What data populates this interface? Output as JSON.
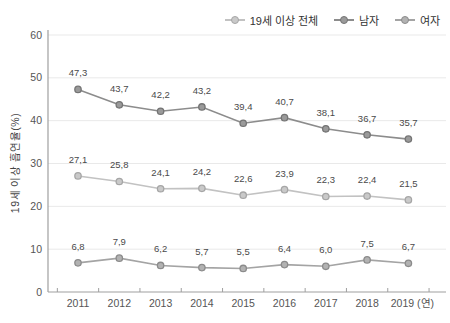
{
  "chart_data": {
    "type": "line",
    "title": "",
    "ylabel": "19세 이상 흡연율(%)",
    "xlabel": "",
    "x_suffix": "(연)",
    "categories": [
      "2011",
      "2012",
      "2013",
      "2014",
      "2015",
      "2016",
      "2017",
      "2018",
      "2019"
    ],
    "yticks": [
      0,
      10,
      20,
      30,
      40,
      50,
      60
    ],
    "ylim": [
      0,
      60
    ],
    "grid": true,
    "legend_position": "top-right",
    "series": [
      {
        "name": "19세 이상 전체",
        "values": [
          27.1,
          25.8,
          24.1,
          24.2,
          22.6,
          23.9,
          22.3,
          22.4,
          21.5
        ],
        "labels": [
          "27,1",
          "25,8",
          "24,1",
          "24,2",
          "22,6",
          "23,9",
          "22,3",
          "22,4",
          "21,5"
        ],
        "line_color": "#c2c2c2",
        "marker_fill": "#c9c9c9",
        "marker_stroke": "#a6a6a6"
      },
      {
        "name": "남자",
        "values": [
          47.3,
          43.7,
          42.2,
          43.2,
          39.4,
          40.7,
          38.1,
          36.7,
          35.7
        ],
        "labels": [
          "47,3",
          "43,7",
          "42,2",
          "43,2",
          "39,4",
          "40,7",
          "38,1",
          "36,7",
          "35,7"
        ],
        "line_color": "#8c8c8c",
        "marker_fill": "#9a9a9a",
        "marker_stroke": "#747474"
      },
      {
        "name": "여자",
        "values": [
          6.8,
          7.9,
          6.2,
          5.7,
          5.5,
          6.4,
          6.0,
          7.5,
          6.7
        ],
        "labels": [
          "6,8",
          "7,9",
          "6,2",
          "5,7",
          "5,5",
          "6,4",
          "6,0",
          "7,5",
          "6,7"
        ],
        "line_color": "#a4a4a4",
        "marker_fill": "#b2b2b2",
        "marker_stroke": "#8b8b8b"
      }
    ],
    "label_color": "#4a4a4a",
    "axis_color": "#9f9f9f",
    "tick_text_color": "#555555",
    "grid_color": "#e9e9e9"
  }
}
